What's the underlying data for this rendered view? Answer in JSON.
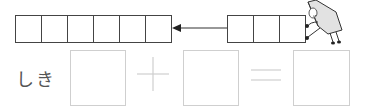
{
  "diagram": {
    "left_group": {
      "cell_count": 6
    },
    "right_group": {
      "cell_count": 3
    },
    "arrow": {
      "direction": "left",
      "color": "#333333"
    },
    "character": {
      "name": "paper-character",
      "pose": "pushing boxes"
    }
  },
  "equation": {
    "label": "しき",
    "operand1": "",
    "operator1": "+",
    "operand2": "",
    "operator2": "=",
    "result": "",
    "box_border_color": "#cfcfcf",
    "operator_color": "#d0d0d0"
  }
}
